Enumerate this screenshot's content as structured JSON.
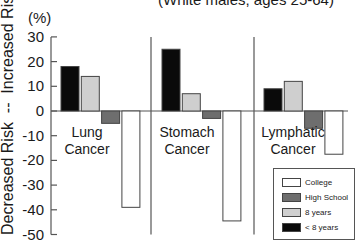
{
  "chart_data": {
    "type": "bar",
    "title": "",
    "subtitle": "(White males, ages 25-64)",
    "unit_label": "(%)",
    "xlabel": "",
    "ylabel": "Decreased Risk  --  Increased Risk",
    "ylim": [
      -50,
      30
    ],
    "yticks": [
      30,
      20,
      10,
      0,
      -10,
      -20,
      -30,
      -40,
      -50
    ],
    "ytick_labels": [
      "30",
      "20",
      "10",
      "0",
      "-10",
      "-20",
      "-30",
      "-40",
      "-50"
    ],
    "categories": [
      "Lung Cancer",
      "Stomach Cancer",
      "Lymphatic Cancer"
    ],
    "category_lines": [
      [
        "Lung",
        "Cancer"
      ],
      [
        "Stomach",
        "Cancer"
      ],
      [
        "Lymphatic",
        "Cancer"
      ]
    ],
    "series": [
      {
        "name": "< 8 years",
        "color": "#0a0a0a",
        "values": [
          18,
          25,
          9
        ]
      },
      {
        "name": "8 years",
        "color": "#cfcfcf",
        "values": [
          14,
          7,
          12
        ]
      },
      {
        "name": "High School",
        "color": "#6e6e6e",
        "values": [
          -5,
          -3,
          -7
        ]
      },
      {
        "name": "College",
        "color": "#ffffff",
        "values": [
          -39,
          -44.5,
          -17.5
        ]
      }
    ],
    "legend": {
      "position": "lower right",
      "entries": [
        {
          "label": "College",
          "color": "#ffffff"
        },
        {
          "label": "High School",
          "color": "#6e6e6e"
        },
        {
          "label": "8 years",
          "color": "#cfcfcf"
        },
        {
          "label": "< 8 years",
          "color": "#0a0a0a"
        }
      ]
    },
    "grid": false
  }
}
